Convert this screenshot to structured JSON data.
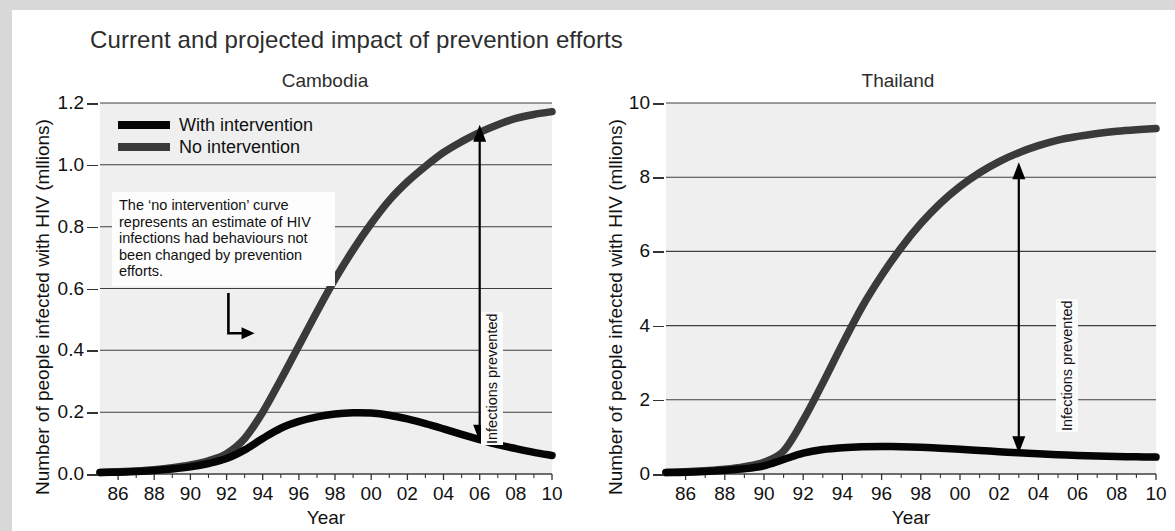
{
  "figure": {
    "title": "Current and projected impact of prevention efforts"
  },
  "legend": {
    "items": [
      {
        "label": "With intervention",
        "color": "#050505"
      },
      {
        "label": "No intervention",
        "color": "#3a3a3a"
      }
    ]
  },
  "annotations": {
    "callout_text": "The ‘no intervention’ curve\nrepresents an estimate of HIV\ninfections had behaviours not\nbeen changed by prevention\nefforts.",
    "prevented_label": "Infections prevented"
  },
  "chart_data": [
    {
      "type": "line",
      "title": "Cambodia",
      "xlabel": "Year",
      "ylabel": "Number of people infected with HIV (mllions)",
      "xlim": [
        85,
        10.5
      ],
      "ylim": [
        0.0,
        1.2
      ],
      "grid": true,
      "legend_position": "top-left inside",
      "xticklabels": [
        "86",
        "88",
        "90",
        "92",
        "94",
        "96",
        "98",
        "00",
        "02",
        "04",
        "06",
        "08",
        "10"
      ],
      "yticklabels": [
        "0.0",
        "0.2",
        "0.4",
        "0.6",
        "0.8",
        "1.0",
        "1.2"
      ],
      "x": [
        1985,
        1986,
        1987,
        1988,
        1989,
        1990,
        1991,
        1992,
        1993,
        1994,
        1995,
        1996,
        1997,
        1998,
        1999,
        2000,
        2001,
        2002,
        2003,
        2004,
        2005,
        2006,
        2007,
        2008,
        2009,
        2010
      ],
      "series": [
        {
          "name": "With intervention",
          "color": "#050505",
          "values": [
            0.005,
            0.006,
            0.008,
            0.011,
            0.016,
            0.023,
            0.034,
            0.05,
            0.078,
            0.115,
            0.148,
            0.17,
            0.185,
            0.194,
            0.198,
            0.197,
            0.19,
            0.178,
            0.163,
            0.146,
            0.128,
            0.111,
            0.095,
            0.082,
            0.07,
            0.06
          ]
        },
        {
          "name": "No intervention",
          "color": "#3a3a3a",
          "values": [
            0.005,
            0.007,
            0.01,
            0.014,
            0.02,
            0.029,
            0.043,
            0.066,
            0.115,
            0.2,
            0.305,
            0.415,
            0.525,
            0.63,
            0.725,
            0.81,
            0.885,
            0.945,
            0.995,
            1.04,
            1.075,
            1.105,
            1.13,
            1.15,
            1.163,
            1.172
          ]
        }
      ],
      "prevented_arrow": {
        "year": 2006,
        "from": 0.104,
        "to": 1.13
      }
    },
    {
      "type": "line",
      "title": "Thailand",
      "xlabel": "Year",
      "ylabel": "Number of people infected with HIV (mllions)",
      "xlim": [
        85,
        10.5
      ],
      "ylim": [
        0,
        10
      ],
      "grid": true,
      "legend_position": "none",
      "xticklabels": [
        "86",
        "88",
        "90",
        "92",
        "94",
        "96",
        "98",
        "00",
        "02",
        "04",
        "06",
        "08",
        "10"
      ],
      "yticklabels": [
        "0",
        "2",
        "4",
        "6",
        "8",
        "10"
      ],
      "x": [
        1985,
        1986,
        1987,
        1988,
        1989,
        1990,
        1991,
        1992,
        1993,
        1994,
        1995,
        1996,
        1997,
        1998,
        1999,
        2000,
        2001,
        2002,
        2003,
        2004,
        2005,
        2006,
        2007,
        2008,
        2009,
        2010
      ],
      "series": [
        {
          "name": "With intervention",
          "color": "#050505",
          "values": [
            0.04,
            0.05,
            0.07,
            0.1,
            0.14,
            0.22,
            0.39,
            0.56,
            0.66,
            0.71,
            0.735,
            0.74,
            0.735,
            0.72,
            0.695,
            0.665,
            0.635,
            0.6,
            0.57,
            0.545,
            0.52,
            0.5,
            0.485,
            0.472,
            0.462,
            0.455
          ]
        },
        {
          "name": "No intervention",
          "color": "#3a3a3a",
          "values": [
            0.04,
            0.06,
            0.09,
            0.13,
            0.2,
            0.32,
            0.62,
            1.45,
            2.45,
            3.5,
            4.5,
            5.35,
            6.1,
            6.75,
            7.3,
            7.75,
            8.12,
            8.42,
            8.66,
            8.85,
            9.0,
            9.1,
            9.18,
            9.24,
            9.28,
            9.31
          ]
        }
      ],
      "prevented_arrow": {
        "year": 2003,
        "from": 0.56,
        "to": 8.4
      }
    }
  ]
}
